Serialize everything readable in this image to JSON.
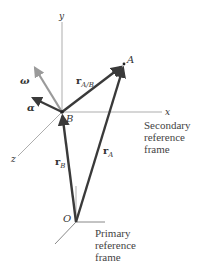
{
  "diagram": {
    "points": {
      "A": {
        "label": "A",
        "x": 124,
        "y": 64
      },
      "B": {
        "label": "B",
        "x": 62,
        "y": 112
      },
      "O": {
        "label": "O",
        "x": 76,
        "y": 222
      }
    },
    "axes": {
      "x": {
        "label": "x"
      },
      "y": {
        "label": "y"
      },
      "z": {
        "label": "z"
      }
    },
    "vectors": {
      "r_AB": {
        "main": "r",
        "sub": "A/B"
      },
      "r_A": {
        "main": "r",
        "sub": "A"
      },
      "r_B": {
        "main": "r",
        "sub": "B"
      },
      "omega": {
        "label": "ω"
      },
      "alpha": {
        "label": "α"
      }
    },
    "frames": {
      "secondary": {
        "lines": [
          "Secondary",
          "reference",
          "frame"
        ]
      },
      "primary": {
        "lines": [
          "Primary",
          "reference",
          "frame"
        ]
      }
    },
    "colors": {
      "vector": "#3a3a3a",
      "omega": "#9a9a9a",
      "axis": "#8a8a8a",
      "text": "#444444"
    }
  }
}
